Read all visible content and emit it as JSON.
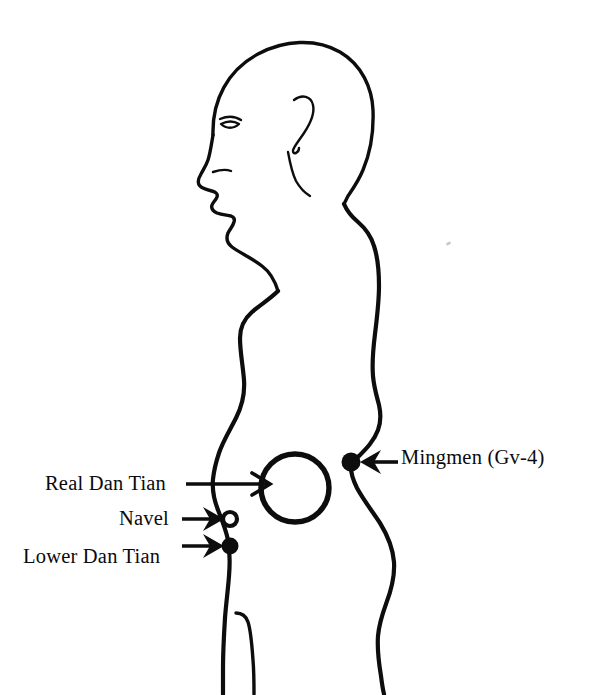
{
  "figure": {
    "background_color": "#ffffff",
    "ink_color": "#0d0d0d",
    "orientation": "left-facing human profile, head to upper thigh"
  },
  "labels": {
    "real_dan_tian": "Real Dan Tian",
    "navel": "Navel",
    "lower_dan_tian": "Lower Dan Tian",
    "mingmen": "Mingmen (Gv-4)"
  },
  "markers": {
    "real_dan_tian_circle": {
      "type": "hollow-circle-large",
      "cx": 295,
      "cy": 488,
      "r": 34
    },
    "navel_point": {
      "type": "hollow-dot",
      "cx": 230,
      "cy": 519,
      "r": 7
    },
    "lower_dan_tian_point": {
      "type": "filled-dot",
      "cx": 230,
      "cy": 546,
      "r": 8
    },
    "mingmen_point": {
      "type": "filled-dot",
      "cx": 351,
      "cy": 462,
      "r": 9
    }
  },
  "arrows": [
    {
      "name": "real-dan-tian-arrow",
      "direction": "right",
      "from_x": 186,
      "to_x": 270,
      "y": 484
    },
    {
      "name": "navel-arrow",
      "direction": "right",
      "from_x": 186,
      "to_x": 224,
      "y": 519
    },
    {
      "name": "lower-dan-tian-arrow",
      "direction": "right",
      "from_x": 186,
      "to_x": 224,
      "y": 546
    },
    {
      "name": "mingmen-arrow",
      "direction": "left",
      "from_x": 398,
      "to_x": 360,
      "y": 462
    }
  ]
}
